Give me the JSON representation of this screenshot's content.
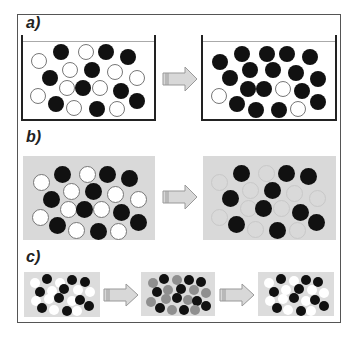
{
  "labels": {
    "a": "a)",
    "b": "b)",
    "c": "c)"
  },
  "colors": {
    "frame": "#555555",
    "beaker_wall": "#222222",
    "box_fill": "#d9d9d9",
    "ball_black": "#111111",
    "ball_white": "#ffffff",
    "ball_gray": "#8f8f8f",
    "arrow_fill": "#d8d8d8"
  },
  "panels": {
    "a": {
      "description": "beaker before/after",
      "before": {
        "balls": [
          {
            "x": 39,
            "y": 61,
            "c": "white"
          },
          {
            "x": 61,
            "y": 52,
            "c": "black"
          },
          {
            "x": 86,
            "y": 52,
            "c": "white"
          },
          {
            "x": 106,
            "y": 52,
            "c": "black"
          },
          {
            "x": 128,
            "y": 57,
            "c": "black"
          },
          {
            "x": 70,
            "y": 70,
            "c": "white"
          },
          {
            "x": 92,
            "y": 70,
            "c": "black"
          },
          {
            "x": 115,
            "y": 72,
            "c": "white"
          },
          {
            "x": 50,
            "y": 78,
            "c": "black"
          },
          {
            "x": 137,
            "y": 78,
            "c": "white"
          },
          {
            "x": 67,
            "y": 88,
            "c": "white"
          },
          {
            "x": 83,
            "y": 88,
            "c": "black"
          },
          {
            "x": 100,
            "y": 88,
            "c": "white"
          },
          {
            "x": 121,
            "y": 91,
            "c": "black"
          },
          {
            "x": 38,
            "y": 96,
            "c": "white"
          },
          {
            "x": 56,
            "y": 104,
            "c": "black"
          },
          {
            "x": 74,
            "y": 108,
            "c": "white"
          },
          {
            "x": 97,
            "y": 109,
            "c": "black"
          },
          {
            "x": 117,
            "y": 109,
            "c": "white"
          },
          {
            "x": 137,
            "y": 101,
            "c": "black"
          }
        ]
      },
      "after": {
        "balls": [
          {
            "x": 220,
            "y": 62,
            "c": "black"
          },
          {
            "x": 242,
            "y": 54,
            "c": "black"
          },
          {
            "x": 267,
            "y": 54,
            "c": "black"
          },
          {
            "x": 287,
            "y": 54,
            "c": "black"
          },
          {
            "x": 310,
            "y": 57,
            "c": "black"
          },
          {
            "x": 250,
            "y": 70,
            "c": "black"
          },
          {
            "x": 273,
            "y": 70,
            "c": "black"
          },
          {
            "x": 296,
            "y": 73,
            "c": "black"
          },
          {
            "x": 230,
            "y": 78,
            "c": "black"
          },
          {
            "x": 318,
            "y": 79,
            "c": "black"
          },
          {
            "x": 248,
            "y": 89,
            "c": "black"
          },
          {
            "x": 264,
            "y": 89,
            "c": "black"
          },
          {
            "x": 283,
            "y": 89,
            "c": "white"
          },
          {
            "x": 302,
            "y": 91,
            "c": "black"
          },
          {
            "x": 219,
            "y": 96,
            "c": "white"
          },
          {
            "x": 237,
            "y": 104,
            "c": "black"
          },
          {
            "x": 256,
            "y": 110,
            "c": "black"
          },
          {
            "x": 279,
            "y": 110,
            "c": "black"
          },
          {
            "x": 298,
            "y": 109,
            "c": "white"
          },
          {
            "x": 318,
            "y": 102,
            "c": "black"
          }
        ]
      }
    },
    "b": {
      "description": "gray box before/after",
      "before": {
        "balls": [
          {
            "x": 41,
            "y": 182,
            "c": "white"
          },
          {
            "x": 62,
            "y": 174,
            "c": "black"
          },
          {
            "x": 87,
            "y": 174,
            "c": "white"
          },
          {
            "x": 107,
            "y": 174,
            "c": "black"
          },
          {
            "x": 129,
            "y": 178,
            "c": "black"
          },
          {
            "x": 71,
            "y": 191,
            "c": "white"
          },
          {
            "x": 93,
            "y": 191,
            "c": "black"
          },
          {
            "x": 115,
            "y": 194,
            "c": "white"
          },
          {
            "x": 51,
            "y": 199,
            "c": "black"
          },
          {
            "x": 138,
            "y": 199,
            "c": "white"
          },
          {
            "x": 68,
            "y": 209,
            "c": "white"
          },
          {
            "x": 84,
            "y": 209,
            "c": "black"
          },
          {
            "x": 101,
            "y": 209,
            "c": "white"
          },
          {
            "x": 121,
            "y": 212,
            "c": "black"
          },
          {
            "x": 40,
            "y": 217,
            "c": "white"
          },
          {
            "x": 57,
            "y": 225,
            "c": "black"
          },
          {
            "x": 76,
            "y": 230,
            "c": "white"
          },
          {
            "x": 98,
            "y": 231,
            "c": "black"
          },
          {
            "x": 118,
            "y": 231,
            "c": "white"
          },
          {
            "x": 138,
            "y": 222,
            "c": "black"
          }
        ]
      },
      "after": {
        "balls": [
          {
            "x": 219,
            "y": 182,
            "c": "faint"
          },
          {
            "x": 241,
            "y": 173,
            "c": "black"
          },
          {
            "x": 266,
            "y": 173,
            "c": "faint"
          },
          {
            "x": 286,
            "y": 173,
            "c": "black"
          },
          {
            "x": 308,
            "y": 176,
            "c": "black"
          },
          {
            "x": 250,
            "y": 190,
            "c": "faint"
          },
          {
            "x": 272,
            "y": 190,
            "c": "black"
          },
          {
            "x": 294,
            "y": 193,
            "c": "faint"
          },
          {
            "x": 230,
            "y": 198,
            "c": "black"
          },
          {
            "x": 317,
            "y": 198,
            "c": "faint"
          },
          {
            "x": 248,
            "y": 208,
            "c": "faint"
          },
          {
            "x": 263,
            "y": 208,
            "c": "black"
          },
          {
            "x": 281,
            "y": 208,
            "c": "faint"
          },
          {
            "x": 300,
            "y": 212,
            "c": "black"
          },
          {
            "x": 219,
            "y": 217,
            "c": "faint"
          },
          {
            "x": 236,
            "y": 224,
            "c": "black"
          },
          {
            "x": 255,
            "y": 229,
            "c": "faint"
          },
          {
            "x": 277,
            "y": 230,
            "c": "black"
          },
          {
            "x": 297,
            "y": 230,
            "c": "faint"
          },
          {
            "x": 316,
            "y": 222,
            "c": "black"
          }
        ]
      }
    },
    "c": {
      "description": "three-stage sequence",
      "stage1": {
        "balls": [
          {
            "x": 35,
            "y": 283,
            "c": "plain-white"
          },
          {
            "x": 47,
            "y": 279,
            "c": "black"
          },
          {
            "x": 60,
            "y": 283,
            "c": "plain-white"
          },
          {
            "x": 72,
            "y": 280,
            "c": "black"
          },
          {
            "x": 85,
            "y": 282,
            "c": "black"
          },
          {
            "x": 52,
            "y": 291,
            "c": "plain-white"
          },
          {
            "x": 64,
            "y": 289,
            "c": "black"
          },
          {
            "x": 78,
            "y": 290,
            "c": "plain-white"
          },
          {
            "x": 40,
            "y": 292,
            "c": "black"
          },
          {
            "x": 90,
            "y": 292,
            "c": "plain-white"
          },
          {
            "x": 36,
            "y": 301,
            "c": "plain-white"
          },
          {
            "x": 49,
            "y": 299,
            "c": "plain-white"
          },
          {
            "x": 59,
            "y": 298,
            "c": "black"
          },
          {
            "x": 72,
            "y": 301,
            "c": "plain-white"
          },
          {
            "x": 80,
            "y": 300,
            "c": "black"
          },
          {
            "x": 42,
            "y": 308,
            "c": "black"
          },
          {
            "x": 54,
            "y": 310,
            "c": "plain-white"
          },
          {
            "x": 67,
            "y": 311,
            "c": "black"
          },
          {
            "x": 77,
            "y": 311,
            "c": "plain-white"
          },
          {
            "x": 89,
            "y": 306,
            "c": "black"
          }
        ]
      },
      "stage2": {
        "balls": [
          {
            "x": 153,
            "y": 283,
            "c": "gray"
          },
          {
            "x": 164,
            "y": 279,
            "c": "black"
          },
          {
            "x": 177,
            "y": 280,
            "c": "gray"
          },
          {
            "x": 189,
            "y": 280,
            "c": "black"
          },
          {
            "x": 201,
            "y": 282,
            "c": "black"
          },
          {
            "x": 168,
            "y": 290,
            "c": "gray"
          },
          {
            "x": 181,
            "y": 289,
            "c": "black"
          },
          {
            "x": 194,
            "y": 290,
            "c": "gray"
          },
          {
            "x": 157,
            "y": 292,
            "c": "black"
          },
          {
            "x": 206,
            "y": 293,
            "c": "gray"
          },
          {
            "x": 166,
            "y": 299,
            "c": "gray"
          },
          {
            "x": 177,
            "y": 298,
            "c": "black"
          },
          {
            "x": 188,
            "y": 300,
            "c": "gray"
          },
          {
            "x": 197,
            "y": 301,
            "c": "black"
          },
          {
            "x": 151,
            "y": 302,
            "c": "gray"
          },
          {
            "x": 160,
            "y": 308,
            "c": "black"
          },
          {
            "x": 172,
            "y": 310,
            "c": "gray"
          },
          {
            "x": 184,
            "y": 310,
            "c": "black"
          },
          {
            "x": 195,
            "y": 310,
            "c": "gray"
          },
          {
            "x": 206,
            "y": 306,
            "c": "black"
          }
        ]
      },
      "stage3": {
        "balls": [
          {
            "x": 269,
            "y": 283,
            "c": "plain-white"
          },
          {
            "x": 281,
            "y": 279,
            "c": "black"
          },
          {
            "x": 294,
            "y": 281,
            "c": "plain-white"
          },
          {
            "x": 306,
            "y": 280,
            "c": "black"
          },
          {
            "x": 318,
            "y": 282,
            "c": "black"
          },
          {
            "x": 286,
            "y": 290,
            "c": "plain-white"
          },
          {
            "x": 299,
            "y": 289,
            "c": "black"
          },
          {
            "x": 312,
            "y": 290,
            "c": "plain-white"
          },
          {
            "x": 274,
            "y": 292,
            "c": "black"
          },
          {
            "x": 324,
            "y": 293,
            "c": "plain-white"
          },
          {
            "x": 270,
            "y": 301,
            "c": "plain-white"
          },
          {
            "x": 283,
            "y": 299,
            "c": "plain-white"
          },
          {
            "x": 294,
            "y": 298,
            "c": "black"
          },
          {
            "x": 306,
            "y": 301,
            "c": "plain-white"
          },
          {
            "x": 315,
            "y": 300,
            "c": "black"
          },
          {
            "x": 277,
            "y": 308,
            "c": "black"
          },
          {
            "x": 288,
            "y": 310,
            "c": "plain-white"
          },
          {
            "x": 301,
            "y": 311,
            "c": "black"
          },
          {
            "x": 311,
            "y": 311,
            "c": "plain-white"
          },
          {
            "x": 324,
            "y": 306,
            "c": "black"
          }
        ]
      }
    }
  },
  "icons": {
    "arrow": "right-block-arrow"
  }
}
